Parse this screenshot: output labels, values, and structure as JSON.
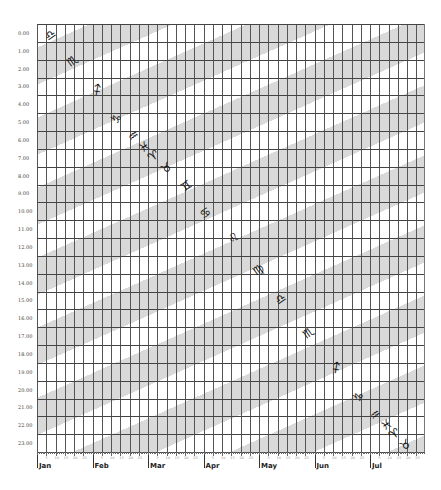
{
  "chart_data": {
    "type": "table",
    "title": "",
    "xlabel": "",
    "ylabel": "",
    "y_ticks": [
      "0.00",
      "1.00",
      "2.00",
      "3.00",
      "4.00",
      "5.00",
      "6.00",
      "7.00",
      "8.00",
      "9.00",
      "10.00",
      "11.00",
      "12.00",
      "13.00",
      "14.00",
      "15.00",
      "16.00",
      "17.00",
      "18.00",
      "19.00",
      "20.00",
      "21.00",
      "22.00",
      "23.00"
    ],
    "x_months": [
      "Jan",
      "Feb",
      "Mar",
      "Apr",
      "May",
      "Jun",
      "Jul"
    ],
    "x_minor_ticks": [
      "5",
      "10",
      "15",
      "20",
      "25"
    ],
    "grid": true,
    "bands": "diagonal light-gray stripes (sidereal time bands)",
    "signs": [
      {
        "symbol": "♎",
        "name": "Libra",
        "month_pos": 0.25,
        "hour": 0.6
      },
      {
        "symbol": "♏",
        "name": "Scorpio",
        "month_pos": 0.65,
        "hour": 2.1
      },
      {
        "symbol": "♐",
        "name": "Sagittarius",
        "month_pos": 1.1,
        "hour": 3.7
      },
      {
        "symbol": "♑",
        "name": "Capricorn",
        "month_pos": 1.45,
        "hour": 5.3
      },
      {
        "symbol": "♒",
        "name": "Aquarius",
        "month_pos": 1.75,
        "hour": 6.3
      },
      {
        "symbol": "♓",
        "name": "Pisces",
        "month_pos": 1.95,
        "hour": 6.9
      },
      {
        "symbol": "♈",
        "name": "Aries",
        "month_pos": 2.1,
        "hour": 7.4
      },
      {
        "symbol": "♉",
        "name": "Taurus",
        "month_pos": 2.35,
        "hour": 8.1
      },
      {
        "symbol": "♊",
        "name": "Gemini",
        "month_pos": 2.7,
        "hour": 9.1
      },
      {
        "symbol": "♋",
        "name": "Cancer",
        "month_pos": 3.05,
        "hour": 10.6
      },
      {
        "symbol": "♌",
        "name": "Leo",
        "month_pos": 3.55,
        "hour": 12.0
      },
      {
        "symbol": "♍",
        "name": "Virgo",
        "month_pos": 4.0,
        "hour": 13.8
      },
      {
        "symbol": "♎",
        "name": "Libra",
        "month_pos": 4.4,
        "hour": 15.4
      },
      {
        "symbol": "♏",
        "name": "Scorpio",
        "month_pos": 4.9,
        "hour": 17.3
      },
      {
        "symbol": "♐",
        "name": "Sagittarius",
        "month_pos": 5.4,
        "hour": 19.3
      },
      {
        "symbol": "♑",
        "name": "Capricorn",
        "month_pos": 5.8,
        "hour": 20.9
      },
      {
        "symbol": "♒",
        "name": "Aquarius",
        "month_pos": 6.1,
        "hour": 21.9
      },
      {
        "symbol": "♓",
        "name": "Pisces",
        "month_pos": 6.3,
        "hour": 22.5
      },
      {
        "symbol": "♈",
        "name": "Aries",
        "month_pos": 6.45,
        "hour": 23.0
      },
      {
        "symbol": "♉",
        "name": "Taurus",
        "month_pos": 6.65,
        "hour": 23.6
      }
    ]
  }
}
